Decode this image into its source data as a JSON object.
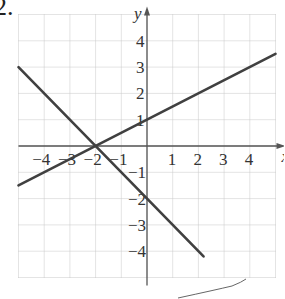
{
  "problem_number": "2.",
  "chart_data": {
    "type": "line",
    "title": "",
    "xlabel": "x",
    "ylabel": "y",
    "xlim": [
      -5,
      5
    ],
    "ylim": [
      -5,
      5
    ],
    "grid": true,
    "x_ticks": [
      -4,
      -3,
      -2,
      -1,
      1,
      2,
      3,
      4
    ],
    "y_ticks": [
      4,
      3,
      2,
      1,
      -1,
      -2,
      -3,
      -4
    ],
    "series": [
      {
        "name": "line-1",
        "x": [
          -5,
          5
        ],
        "y": [
          -1.5,
          3.5
        ],
        "equation": "y = 0.5x + 1"
      },
      {
        "name": "line-2",
        "x": [
          -5,
          2.2
        ],
        "y": [
          3,
          -4.2
        ],
        "equation": "y = -x - 2"
      }
    ]
  },
  "colors": {
    "grid": "#c8c8c8",
    "axis": "#555555",
    "line": "#404040"
  }
}
